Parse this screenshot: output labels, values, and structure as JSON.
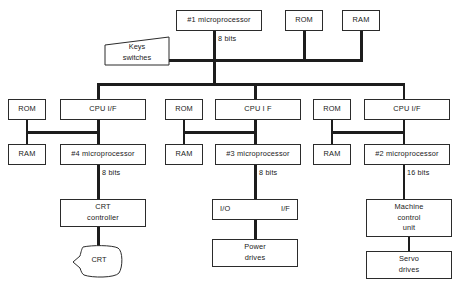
{
  "diagram": {
    "type": "block-diagram",
    "colors": {
      "line": "#1d1d1d",
      "box_border": "#2b2b2b",
      "background": "#ffffff",
      "text": "#1a1a1a"
    },
    "nodes": {
      "cpu1": "#1 microprocessor",
      "rom_top": "ROM",
      "ram_top": "RAM",
      "keys_switches": "Keys\nswitches",
      "cpu_if_left": "CPU I/F",
      "cpu_if_mid": "CPU I F",
      "cpu_if_right": "CPU  I/F",
      "rom_left": "ROM",
      "rom_mid": "ROM",
      "rom_right": "ROM",
      "ram_left": "RAM",
      "ram_mid": "RAM",
      "ram_right": "RAM",
      "cpu4": "#4 microprocessor",
      "cpu3": "#3 microprocessor",
      "cpu2": "#2 microprocessor",
      "crt_controller": "CRT\ncontroller",
      "crt": "CRT",
      "io_label": "I/O",
      "if_label": "I/F",
      "power_drives": "Power\ndrives",
      "machine_control_unit": "Machine\ncontrol\nunit",
      "servo_drives": "Servo\ndrives"
    },
    "bus_labels": {
      "bus_main": "8 bits",
      "bus_cpu4": "8 bits",
      "bus_cpu3": "8 bits",
      "bus_cpu2": "16 bits"
    },
    "caption": ""
  }
}
